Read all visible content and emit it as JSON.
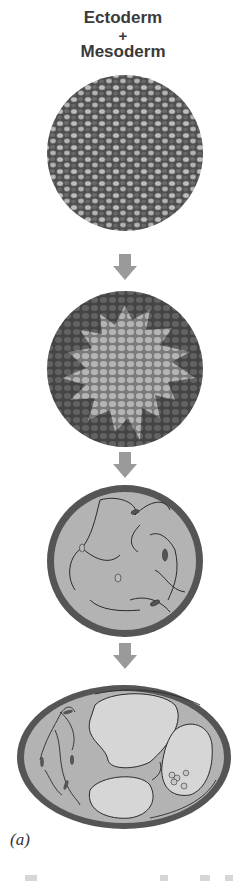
{
  "figure": {
    "title_line1": "Ectoderm",
    "title_plus": "+",
    "title_line2": "Mesoderm",
    "panel_label": "(a)",
    "stages": [
      {
        "id": "stage-1",
        "description": "mixed ectoderm and mesoderm cells (random mosaic)"
      },
      {
        "id": "stage-2",
        "description": "cells sorting: light cells aggregate in center"
      },
      {
        "id": "stage-3",
        "description": "sphere with outer layer and mesenchymal fibroblast cells"
      },
      {
        "id": "stage-4",
        "description": "oval structure with cavities and outer layer"
      }
    ],
    "arrows": 3,
    "colors": {
      "dark_cell": "#5a5a5a",
      "light_cell": "#a8a8a8",
      "background": "#ffffff",
      "arrow": "#9a9a9a",
      "ring": "#555555",
      "fill": "#b0b0b0",
      "cavity": "#d4d4d4"
    }
  }
}
